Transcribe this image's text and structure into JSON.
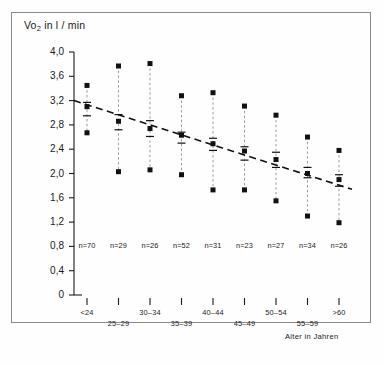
{
  "figure": {
    "title": "Vo2 in l / min",
    "title_base": "Vo",
    "title_sub": "2",
    "title_rest": " in l / min",
    "x_axis_title": "Alter in Jahren",
    "caption": ""
  },
  "chart_data": {
    "type": "scatter",
    "title": "Vo2 in l / min",
    "xlabel": "Alter in Jahren",
    "ylabel": "Vo2 in l / min",
    "ylim": [
      0,
      4.0
    ],
    "ytick_values": [
      0,
      0.4,
      0.8,
      1.2,
      1.6,
      2.0,
      2.4,
      2.8,
      3.2,
      3.6,
      4.0
    ],
    "ytick_labels": [
      "0",
      "0,4",
      "0,8",
      "1,2",
      "1,6",
      "2,0",
      "2,4",
      "2,8",
      "3,2",
      "3,6",
      "4,0"
    ],
    "categories": [
      "<24",
      "25-29",
      "30-34",
      "35-39",
      "40-44",
      "45-49",
      "50-54",
      "55-59",
      ">60"
    ],
    "n_labels": [
      "n=70",
      "n=29",
      "n=26",
      "n=52",
      "n=31",
      "n=23",
      "n=27",
      "n=34",
      "n=26"
    ],
    "n_values": [
      70,
      29,
      26,
      52,
      31,
      23,
      27,
      34,
      26
    ],
    "grid": false,
    "legend": "none",
    "series": [
      {
        "name": "Maximum",
        "values": [
          3.45,
          3.77,
          3.81,
          3.28,
          3.33,
          3.11,
          2.96,
          2.6,
          2.38
        ]
      },
      {
        "name": "Upper range tick",
        "values": [
          3.17,
          2.97,
          2.87,
          2.68,
          2.58,
          2.44,
          2.35,
          2.1,
          1.98
        ]
      },
      {
        "name": "Mean",
        "values": [
          3.1,
          2.86,
          2.74,
          2.63,
          2.49,
          2.37,
          2.23,
          2.0,
          1.9
        ]
      },
      {
        "name": "Lower range tick",
        "values": [
          2.95,
          2.72,
          2.61,
          2.5,
          2.38,
          2.22,
          2.1,
          1.93,
          1.79
        ]
      },
      {
        "name": "Minimum",
        "values": [
          2.67,
          2.03,
          2.06,
          1.98,
          1.73,
          1.73,
          1.55,
          1.3,
          1.19
        ]
      }
    ],
    "trend_line": {
      "name": "Regressionsgerade",
      "style": "dashed",
      "x_start_category": "<24",
      "x_end_category": ">60",
      "y_start": 3.2,
      "y_end": 1.74
    }
  },
  "y_axis": {
    "ticks": [
      {
        "label": "4,0",
        "value": 4.0
      },
      {
        "label": "3,6",
        "value": 3.6
      },
      {
        "label": "3,2",
        "value": 3.2
      },
      {
        "label": "2,8",
        "value": 2.8
      },
      {
        "label": "2,4",
        "value": 2.4
      },
      {
        "label": "2,0",
        "value": 2.0
      },
      {
        "label": "1,6",
        "value": 1.6
      },
      {
        "label": "1,2",
        "value": 1.2
      },
      {
        "label": "0,8",
        "value": 0.8
      },
      {
        "label": "0,4",
        "value": 0.4
      },
      {
        "label": "0",
        "value": 0.0
      }
    ]
  },
  "x_axis": {
    "ticks": [
      {
        "label": "<24",
        "row": 0
      },
      {
        "label": "25–29",
        "row": 1
      },
      {
        "label": "30–34",
        "row": 0
      },
      {
        "label": "35–39",
        "row": 1
      },
      {
        "label": "40–44",
        "row": 0
      },
      {
        "label": "45–49",
        "row": 1
      },
      {
        "label": "50–54",
        "row": 0
      },
      {
        "label": "55–59",
        "row": 1
      },
      {
        "label": ">60",
        "row": 0
      }
    ]
  },
  "colors": {
    "ink": "#1a1a1a",
    "frame": "#8a8a8a",
    "marker": "#111111",
    "range_line": "#9a9a9a",
    "trend": "#111111",
    "background": "#fefefe"
  }
}
